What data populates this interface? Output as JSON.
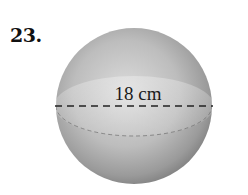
{
  "problem": {
    "number": "23."
  },
  "figure": {
    "shape": "sphere",
    "dimension_label": "18 cm",
    "dimension_type": "diameter",
    "colors": {
      "sphere_light": "#d9d9d9",
      "sphere_mid": "#b0b0b0",
      "sphere_dark": "#7a7a7a",
      "dash_line": "#222222"
    }
  }
}
